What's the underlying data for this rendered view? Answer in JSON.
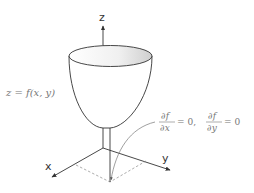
{
  "diagram": {
    "type": "3d-surface-critical-point",
    "axes": {
      "x_label": "x",
      "y_label": "y",
      "z_label": "z"
    },
    "surface_label": "z = f(x, y)",
    "condition": {
      "df_dx": {
        "numerator": "∂f",
        "denominator": "∂x",
        "equals": "= 0,"
      },
      "df_dy": {
        "numerator": "∂f",
        "denominator": "∂y",
        "equals": "= 0"
      }
    },
    "colors": {
      "outline": "#333333",
      "text": "#777777",
      "guide": "#888888",
      "rim_fill_light": "#ffffff",
      "rim_fill_dark": "#cfcfcf"
    }
  }
}
